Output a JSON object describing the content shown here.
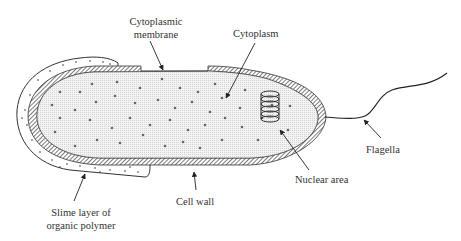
{
  "diagram": {
    "labels": {
      "cytoplasmic_membrane_line1": "Cytoplasmic",
      "cytoplasmic_membrane_line2": "membrane",
      "cytoplasm": "Cytoplasm",
      "flagella": "Flagella",
      "nuclear_area": "Nuclear area",
      "cell_wall": "Cell wall",
      "slime_layer_line1": "Slime layer of",
      "slime_layer_line2": "organic polymer"
    },
    "colors": {
      "outline": "#333333",
      "cytoplasm_fill": "#ececec",
      "wall_hatch": "#444444",
      "text": "#333333",
      "background": "#ffffff"
    }
  }
}
